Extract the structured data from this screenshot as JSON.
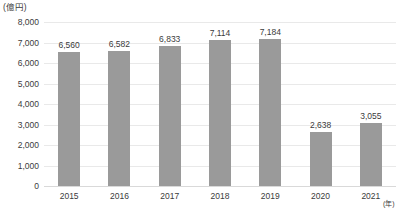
{
  "chart_data": {
    "type": "bar",
    "title": "",
    "subtitle": "",
    "xlabel": "(年)",
    "ylabel": "(億円)",
    "categories": [
      "2015",
      "2016",
      "2017",
      "2018",
      "2019",
      "2020",
      "2021"
    ],
    "values": [
      6560,
      6582,
      6833,
      7114,
      7184,
      2638,
      3055
    ],
    "value_labels": [
      "6,560",
      "6,582",
      "6,833",
      "7,114",
      "7,184",
      "2,638",
      "3,055"
    ],
    "ylim": [
      0,
      8000
    ],
    "ytick_values": [
      0,
      1000,
      2000,
      3000,
      4000,
      5000,
      6000,
      7000,
      8000
    ],
    "ytick_labels": [
      "0",
      "1,000",
      "2,000",
      "3,000",
      "4,000",
      "5,000",
      "6,000",
      "7,000",
      "8,000"
    ],
    "grid": true,
    "legend": "none",
    "series": [
      {
        "name": "",
        "values": [
          6560,
          6582,
          6833,
          7114,
          7184,
          2638,
          3055
        ]
      }
    ],
    "colors": {
      "bar": "#9a9a9a",
      "gridline": "#e9e9e9",
      "baseline": "#d9d9d9",
      "text": "#3b3b3b",
      "background": "#ffffff"
    }
  }
}
